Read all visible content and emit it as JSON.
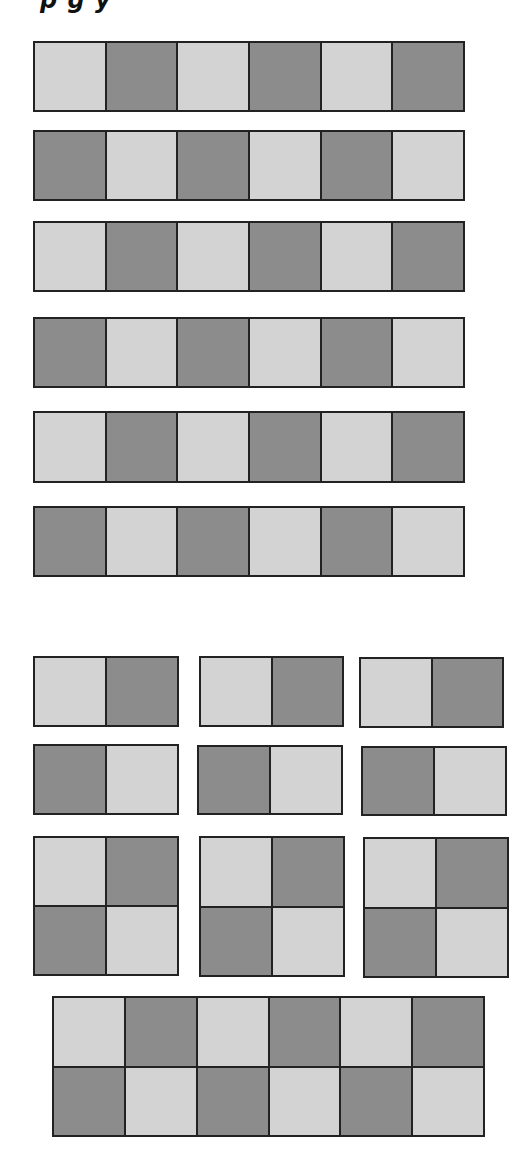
{
  "title": {
    "visible_text": "p   g         y",
    "note": "only descenders of a cut-off heading are visible"
  },
  "colors": {
    "light": "#d3d3d3",
    "dark": "#8c8c8c",
    "border": "#222222",
    "background": "#ffffff"
  },
  "section1": {
    "description": "six horizontal strips of 1x6 alternating squares",
    "strips": [
      {
        "x": 33,
        "y": 41,
        "w": 432,
        "h": 71,
        "rows": 1,
        "cols": 6,
        "pattern": [
          [
            "L",
            "D",
            "L",
            "D",
            "L",
            "D"
          ]
        ]
      },
      {
        "x": 33,
        "y": 130,
        "w": 432,
        "h": 71,
        "rows": 1,
        "cols": 6,
        "pattern": [
          [
            "D",
            "L",
            "D",
            "L",
            "D",
            "L"
          ]
        ]
      },
      {
        "x": 33,
        "y": 221,
        "w": 432,
        "h": 71,
        "rows": 1,
        "cols": 6,
        "pattern": [
          [
            "L",
            "D",
            "L",
            "D",
            "L",
            "D"
          ]
        ]
      },
      {
        "x": 33,
        "y": 317,
        "w": 432,
        "h": 71,
        "rows": 1,
        "cols": 6,
        "pattern": [
          [
            "D",
            "L",
            "D",
            "L",
            "D",
            "L"
          ]
        ]
      },
      {
        "x": 33,
        "y": 411,
        "w": 432,
        "h": 72,
        "rows": 1,
        "cols": 6,
        "pattern": [
          [
            "L",
            "D",
            "L",
            "D",
            "L",
            "D"
          ]
        ]
      },
      {
        "x": 33,
        "y": 506,
        "w": 432,
        "h": 71,
        "rows": 1,
        "cols": 6,
        "pattern": [
          [
            "D",
            "L",
            "D",
            "L",
            "D",
            "L"
          ]
        ]
      }
    ]
  },
  "section2": {
    "description": "pieces: 1x2 dominoes, 2x2 squares, and a 2x6 rectangle",
    "pieces": [
      {
        "x": 33,
        "y": 656,
        "w": 146,
        "h": 71,
        "rows": 1,
        "cols": 2,
        "pattern": [
          [
            "L",
            "D"
          ]
        ]
      },
      {
        "x": 199,
        "y": 656,
        "w": 145,
        "h": 71,
        "rows": 1,
        "cols": 2,
        "pattern": [
          [
            "L",
            "D"
          ]
        ]
      },
      {
        "x": 359,
        "y": 657,
        "w": 145,
        "h": 71,
        "rows": 1,
        "cols": 2,
        "pattern": [
          [
            "L",
            "D"
          ]
        ]
      },
      {
        "x": 33,
        "y": 744,
        "w": 146,
        "h": 71,
        "rows": 1,
        "cols": 2,
        "pattern": [
          [
            "D",
            "L"
          ]
        ]
      },
      {
        "x": 197,
        "y": 745,
        "w": 146,
        "h": 70,
        "rows": 1,
        "cols": 2,
        "pattern": [
          [
            "D",
            "L"
          ]
        ]
      },
      {
        "x": 361,
        "y": 746,
        "w": 146,
        "h": 70,
        "rows": 1,
        "cols": 2,
        "pattern": [
          [
            "D",
            "L"
          ]
        ]
      },
      {
        "x": 33,
        "y": 836,
        "w": 146,
        "h": 140,
        "rows": 2,
        "cols": 2,
        "pattern": [
          [
            "L",
            "D"
          ],
          [
            "D",
            "L"
          ]
        ]
      },
      {
        "x": 199,
        "y": 836,
        "w": 146,
        "h": 141,
        "rows": 2,
        "cols": 2,
        "pattern": [
          [
            "L",
            "D"
          ],
          [
            "D",
            "L"
          ]
        ]
      },
      {
        "x": 363,
        "y": 837,
        "w": 146,
        "h": 141,
        "rows": 2,
        "cols": 2,
        "pattern": [
          [
            "L",
            "D"
          ],
          [
            "D",
            "L"
          ]
        ]
      },
      {
        "x": 52,
        "y": 996,
        "w": 433,
        "h": 141,
        "rows": 2,
        "cols": 6,
        "pattern": [
          [
            "L",
            "D",
            "L",
            "D",
            "L",
            "D"
          ],
          [
            "D",
            "L",
            "D",
            "L",
            "D",
            "L"
          ]
        ]
      }
    ]
  }
}
